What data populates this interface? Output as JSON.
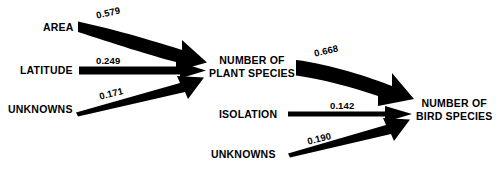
{
  "diagram": {
    "type": "path-diagram",
    "title": "",
    "background_color": "#ffffff",
    "stroke_color": "#000000",
    "nodes": [
      {
        "id": "area",
        "label": "AREA",
        "lines": [
          "AREA"
        ],
        "x": 42,
        "y": 21
      },
      {
        "id": "latitude",
        "label": "LATITUDE",
        "lines": [
          "LATITUDE"
        ],
        "x": 19,
        "y": 64
      },
      {
        "id": "unknowns-1",
        "label": "UNKNOWNS",
        "lines": [
          "UNKNOWNS"
        ],
        "x": 7,
        "y": 103
      },
      {
        "id": "plant-species",
        "label": "NUMBER OF PLANT SPECIES",
        "lines": [
          "NUMBER OF",
          "PLANT SPECIES"
        ],
        "x": 208,
        "y": 54
      },
      {
        "id": "isolation",
        "label": "ISOLATION",
        "lines": [
          "ISOLATION"
        ],
        "x": 218,
        "y": 108
      },
      {
        "id": "unknowns-2",
        "label": "UNKNOWNS",
        "lines": [
          "UNKNOWNS"
        ],
        "x": 210,
        "y": 148
      },
      {
        "id": "bird-species",
        "label": "NUMBER OF BIRD SPECIES",
        "lines": [
          "NUMBER OF",
          "BIRD SPECIES"
        ],
        "x": 415,
        "y": 97
      }
    ],
    "edges": [
      {
        "id": "area-to-plant",
        "from": "AREA",
        "to": "NUMBER OF PLANT SPECIES",
        "coefficient": "0.579",
        "label_x": 95,
        "label_y": 10,
        "label_rotation": -13
      },
      {
        "id": "latitude-to-plant",
        "from": "LATITUDE",
        "to": "NUMBER OF PLANT SPECIES",
        "coefficient": "0.249",
        "label_x": 96,
        "label_y": 55,
        "label_rotation": 0
      },
      {
        "id": "unknowns1-to-plant",
        "from": "UNKNOWNS",
        "to": "NUMBER OF PLANT SPECIES",
        "coefficient": "0.171",
        "label_x": 98,
        "label_y": 91,
        "label_rotation": -14
      },
      {
        "id": "plant-to-bird",
        "from": "NUMBER OF PLANT SPECIES",
        "to": "NUMBER OF BIRD SPECIES",
        "coefficient": "0.668",
        "label_x": 313,
        "label_y": 48,
        "label_rotation": -13
      },
      {
        "id": "isolation-to-bird",
        "from": "ISOLATION",
        "to": "NUMBER OF BIRD SPECIES",
        "coefficient": "0.142",
        "label_x": 330,
        "label_y": 100,
        "label_rotation": 0
      },
      {
        "id": "unknowns2-to-bird",
        "from": "UNKNOWNS",
        "to": "NUMBER OF BIRD SPECIES",
        "coefficient": "0.190",
        "label_x": 306,
        "label_y": 136,
        "label_rotation": -14
      }
    ]
  }
}
